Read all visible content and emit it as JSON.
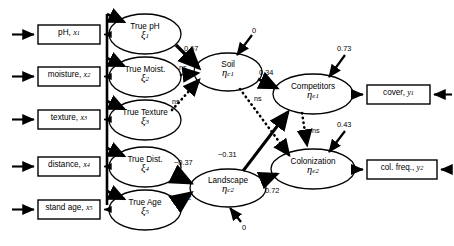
{
  "diagram": {
    "type": "structural-equation-model-path-diagram",
    "background": "#ffffff",
    "stroke_color": "#000000"
  },
  "indicators": [
    {
      "id": "ph",
      "label": "pH, ",
      "var": "x",
      "sub": "1"
    },
    {
      "id": "moisture",
      "label": "moisture, ",
      "var": "x",
      "sub": "2"
    },
    {
      "id": "texture",
      "label": "texture, ",
      "var": "x",
      "sub": "3"
    },
    {
      "id": "distance",
      "label": "distance, ",
      "var": "x",
      "sub": "4"
    },
    {
      "id": "standage",
      "label": "stand age, ",
      "var": "x",
      "sub": "5"
    }
  ],
  "outcomes": [
    {
      "id": "cover",
      "label": "cover, ",
      "var": "y",
      "sub": "1"
    },
    {
      "id": "colfreq",
      "label": "col. freq., ",
      "var": "y",
      "sub": "2"
    }
  ],
  "latent_exogenous": [
    {
      "id": "true-ph",
      "name": "True pH",
      "symbol": "ξ",
      "sub": "1"
    },
    {
      "id": "true-moist",
      "name": "True Moist.",
      "symbol": "ξ",
      "sub": "2"
    },
    {
      "id": "true-texture",
      "name": "True Texture",
      "symbol": "ξ",
      "sub": "3"
    },
    {
      "id": "true-dist",
      "name": "True Dist.",
      "symbol": "ξ",
      "sub": "4"
    },
    {
      "id": "true-age",
      "name": "True Age",
      "symbol": "ξ",
      "sub": "5"
    }
  ],
  "latent_composite": [
    {
      "id": "soil",
      "name": "Soil",
      "symbol": "η",
      "sub": "c1"
    },
    {
      "id": "landscape",
      "name": "Landscape",
      "symbol": "η",
      "sub": "c2"
    }
  ],
  "latent_endogenous": [
    {
      "id": "competitors",
      "name": "Competitors",
      "symbol": "η",
      "sub": "e1"
    },
    {
      "id": "colonization",
      "name": "Colonization",
      "symbol": "η",
      "sub": "e2"
    }
  ],
  "paths": [
    {
      "id": "ph-to-soil",
      "from": "true-ph",
      "to": "soil",
      "label": "0.67",
      "style": "solid",
      "significant": true
    },
    {
      "id": "moist-to-soil",
      "from": "true-moist",
      "to": "soil",
      "label": "ns",
      "style": "dotted",
      "significant": false
    },
    {
      "id": "texture-to-soil",
      "from": "true-texture",
      "to": "soil",
      "label": "ns",
      "style": "dotted",
      "significant": false
    },
    {
      "id": "dist-to-landscape",
      "from": "true-dist",
      "to": "landscape",
      "label": "−0.37",
      "style": "solid",
      "significant": true
    },
    {
      "id": "age-to-landscape",
      "from": "true-age",
      "to": "landscape",
      "label": "0.72",
      "style": "solid",
      "significant": true
    },
    {
      "id": "soil-to-competitors",
      "from": "soil",
      "to": "competitors",
      "label": "0.34",
      "style": "solid",
      "significant": true
    },
    {
      "id": "soil-to-colonization",
      "from": "soil",
      "to": "colonization",
      "label": "ns",
      "style": "dotted",
      "significant": false
    },
    {
      "id": "landscape-to-competitors",
      "from": "landscape",
      "to": "competitors",
      "label": "−0.31",
      "style": "solid",
      "significant": true
    },
    {
      "id": "landscape-to-colonization",
      "from": "landscape",
      "to": "colonization",
      "label": "0.72",
      "style": "solid",
      "significant": true
    },
    {
      "id": "competitors-to-colonization",
      "from": "competitors",
      "to": "colonization",
      "label": "ns",
      "style": "dotted",
      "significant": false
    }
  ],
  "disturbances": [
    {
      "id": "soil-error",
      "target": "soil",
      "label": "0"
    },
    {
      "id": "landscape-error",
      "target": "landscape",
      "label": "0"
    },
    {
      "id": "competitors-error",
      "target": "competitors",
      "label": "0.73"
    },
    {
      "id": "colonization-error",
      "target": "colonization",
      "label": "0.43"
    }
  ]
}
